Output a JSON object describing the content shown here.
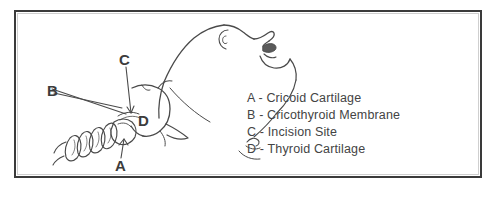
{
  "figure": {
    "type": "anatomical-line-drawing",
    "frame_color": "#3a3a3a",
    "background_color": "#ffffff",
    "ink_color": "#4a4a4a"
  },
  "callouts": [
    {
      "key": "A",
      "x": 103,
      "y": 150,
      "target": "cricoid-cartilage"
    },
    {
      "key": "B",
      "x": 40,
      "y": 80,
      "target": "cricothyroid-membrane"
    },
    {
      "key": "C",
      "x": 110,
      "y": 48,
      "target": "incision-site"
    },
    {
      "key": "D",
      "x": 129,
      "y": 105,
      "target": "thyroid-cartilage"
    }
  ],
  "legend": {
    "separator": "-",
    "items": [
      {
        "key": "A",
        "label": "Cricoid Cartilage"
      },
      {
        "key": "B",
        "label": "Cricothyroid Membrane"
      },
      {
        "key": "C",
        "label": "Incision Site"
      },
      {
        "key": "D",
        "label": "Thyroid Cartilage"
      }
    ]
  }
}
